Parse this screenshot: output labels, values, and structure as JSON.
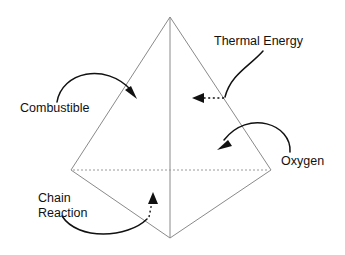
{
  "diagram": {
    "background_color": "#ffffff",
    "edge_color": "#8a8a8a",
    "annotation_color": "#111111",
    "shape": {
      "name": "tetrahedron",
      "vertices": {
        "apex": [
          170,
          17
        ],
        "left": [
          71,
          170
        ],
        "right": [
          271,
          170
        ],
        "bottom": [
          170,
          238
        ]
      },
      "hidden_edge": "left-right"
    },
    "labels": [
      {
        "id": "thermal-energy",
        "text": "Thermal Energy",
        "x": 214,
        "y": 45,
        "anchor": "start",
        "lines": [
          "Thermal Energy"
        ]
      },
      {
        "id": "combustible",
        "text": "Combustible",
        "x": 20,
        "y": 112,
        "anchor": "start",
        "lines": [
          "Combustible"
        ]
      },
      {
        "id": "oxygen",
        "text": "Oxygen",
        "x": 281,
        "y": 165,
        "anchor": "start",
        "lines": [
          "Oxygen"
        ]
      },
      {
        "id": "chain-reaction",
        "text": "Chain Reaction",
        "x": 38,
        "y": 202,
        "anchor": "start",
        "lines": [
          "Chain",
          "Reaction"
        ]
      }
    ],
    "pointers": [
      {
        "id": "combustible-pointer",
        "style": "solid-arc",
        "from_label": "combustible",
        "points_to": "left-front-face"
      },
      {
        "id": "thermal-energy-pointer",
        "style": "solid-arc-then-dotted",
        "from_label": "thermal-energy",
        "points_to": "hidden-back-face"
      },
      {
        "id": "oxygen-pointer",
        "style": "solid-arc",
        "from_label": "oxygen",
        "points_to": "right-front-face"
      },
      {
        "id": "chain-reaction-pointer",
        "style": "solid-arc-then-dotted",
        "from_label": "chain-reaction",
        "points_to": "base-face"
      }
    ]
  }
}
